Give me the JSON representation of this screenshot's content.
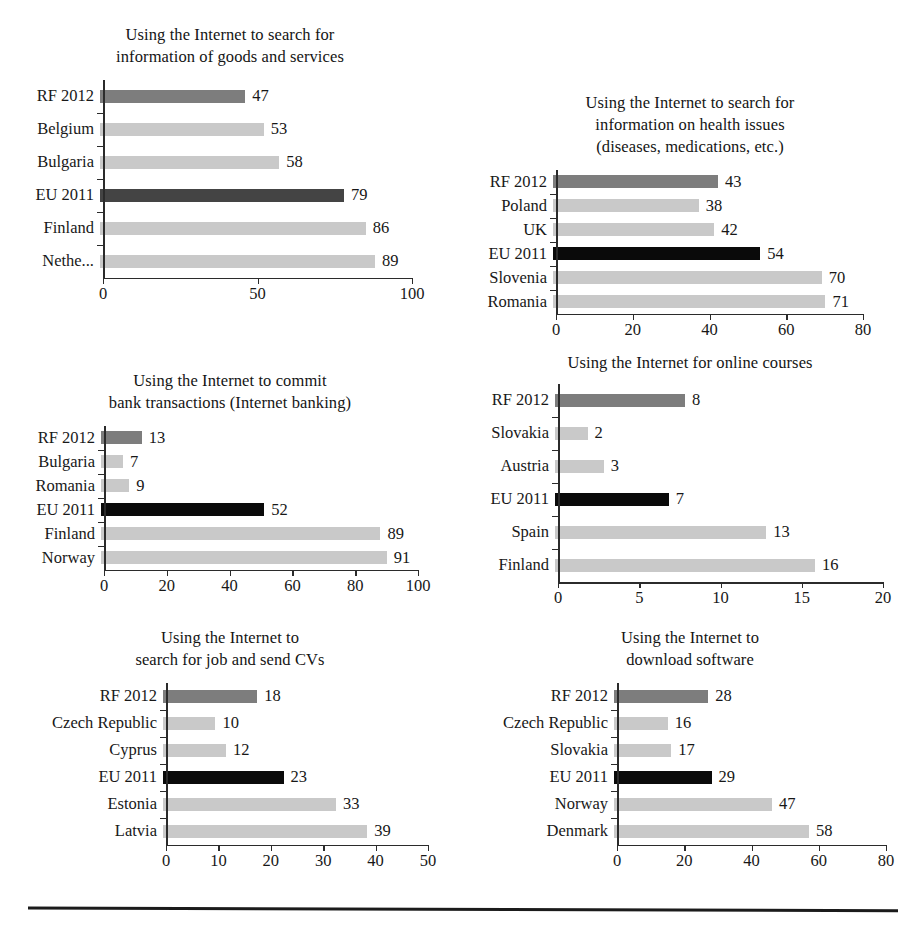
{
  "page": {
    "background": "#ffffff",
    "width": 920,
    "height": 937,
    "bottom_rule": "horizontal-rule"
  },
  "colors": {
    "bar_default": "#c9c9c9",
    "bar_rf": "#7d7d7d",
    "bar_eu": "#0a0a0a",
    "bar_eu_soft": "#444444",
    "axis": "#2b2b2b",
    "text": "#171717"
  },
  "chart_data": [
    {
      "id": "goods-services",
      "type": "bar",
      "orientation": "horizontal",
      "title": "Using the Internet to search for\ninformation of goods and services",
      "categories": [
        "RF 2012",
        "Belgium",
        "Bulgaria",
        "EU 2011",
        "Finland",
        "Nethe..."
      ],
      "values": [
        47,
        53,
        58,
        79,
        86,
        89
      ],
      "styles": [
        "rf",
        "default",
        "default",
        "eu-soft",
        "default",
        "default"
      ],
      "xlabel": "",
      "ylabel": "",
      "xlim": [
        0,
        100
      ],
      "xticks": [
        0,
        50,
        100
      ],
      "xtick_labels": [
        "0",
        "50",
        "100"
      ],
      "grid": false,
      "legend": "none"
    },
    {
      "id": "health-issues",
      "type": "bar",
      "orientation": "horizontal",
      "title": "Using the Internet to search for\ninformation on health issues\n(diseases, medications, etc.)",
      "categories": [
        "RF 2012",
        "Poland",
        "UK",
        "EU 2011",
        "Slovenia",
        "Romania"
      ],
      "values": [
        43,
        38,
        42,
        54,
        70,
        71
      ],
      "styles": [
        "rf",
        "default",
        "default",
        "eu",
        "default",
        "default"
      ],
      "xlabel": "",
      "ylabel": "",
      "xlim": [
        0,
        80
      ],
      "xticks": [
        0,
        20,
        40,
        60,
        80
      ],
      "xtick_labels": [
        "0",
        "20",
        "40",
        "60",
        "80"
      ],
      "grid": false,
      "legend": "none"
    },
    {
      "id": "internet-banking",
      "type": "bar",
      "orientation": "horizontal",
      "title": "Using the Internet to commit\nbank transactions (Internet banking)",
      "categories": [
        "RF 2012",
        "Bulgaria",
        "Romania",
        "EU 2011",
        "Finland",
        "Norway"
      ],
      "values": [
        13,
        7,
        9,
        52,
        89,
        91
      ],
      "styles": [
        "rf",
        "default",
        "default",
        "eu",
        "default",
        "default"
      ],
      "xlabel": "",
      "ylabel": "",
      "xlim": [
        0,
        100
      ],
      "xticks": [
        0,
        20,
        40,
        60,
        80,
        100
      ],
      "xtick_labels": [
        "0",
        "20",
        "40",
        "60",
        "80",
        "100"
      ],
      "grid": false,
      "legend": "none"
    },
    {
      "id": "online-courses",
      "type": "bar",
      "orientation": "horizontal",
      "title": "Using the Internet for online courses",
      "categories": [
        "RF 2012",
        "Slovakia",
        "Austria",
        "EU 2011",
        "Spain",
        "Finland"
      ],
      "values": [
        8,
        2,
        3,
        7,
        13,
        16
      ],
      "styles": [
        "rf",
        "default",
        "default",
        "eu",
        "default",
        "default"
      ],
      "xlabel": "",
      "ylabel": "",
      "xlim": [
        0,
        20
      ],
      "xticks": [
        0,
        5,
        10,
        15,
        20
      ],
      "xtick_labels": [
        "0",
        "5",
        "10",
        "15",
        "20"
      ],
      "grid": false,
      "legend": "none"
    },
    {
      "id": "job-search-cv",
      "type": "bar",
      "orientation": "horizontal",
      "title": "Using the Internet to\nsearch for job and send CVs",
      "categories": [
        "RF 2012",
        "Czech Republic",
        "Cyprus",
        "EU 2011",
        "Estonia",
        "Latvia"
      ],
      "values": [
        18,
        10,
        12,
        23,
        33,
        39
      ],
      "styles": [
        "rf",
        "default",
        "default",
        "eu",
        "default",
        "default"
      ],
      "xlabel": "",
      "ylabel": "",
      "xlim": [
        0,
        50
      ],
      "xticks": [
        0,
        10,
        20,
        30,
        40,
        50
      ],
      "xtick_labels": [
        "0",
        "10",
        "20",
        "30",
        "40",
        "50"
      ],
      "grid": false,
      "legend": "none"
    },
    {
      "id": "download-software",
      "type": "bar",
      "orientation": "horizontal",
      "title": "Using the Internet to\ndownload software",
      "categories": [
        "RF 2012",
        "Czech Republic",
        "Slovakia",
        "EU 2011",
        "Norway",
        "Denmark"
      ],
      "values": [
        28,
        16,
        17,
        29,
        47,
        58
      ],
      "styles": [
        "rf",
        "default",
        "default",
        "eu",
        "default",
        "default"
      ],
      "xlabel": "",
      "ylabel": "",
      "xlim": [
        0,
        80
      ],
      "xticks": [
        0,
        20,
        40,
        60,
        80
      ],
      "xtick_labels": [
        "0",
        "20",
        "40",
        "60",
        "80"
      ],
      "grid": false,
      "legend": "none"
    }
  ]
}
